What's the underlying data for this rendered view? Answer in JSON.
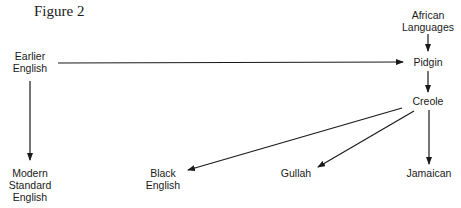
{
  "figure": {
    "title": "Figure  2"
  },
  "nodes": {
    "earlier_english": {
      "line1": "Earlier",
      "line2": "English"
    },
    "african_languages": {
      "line1": "African",
      "line2": "Languages"
    },
    "pidgin": {
      "label": "Pidgin"
    },
    "creole": {
      "label": "Creole"
    },
    "modern_standard_english": {
      "line1": "Modern",
      "line2": "Standard",
      "line3": "English"
    },
    "black_english": {
      "line1": "Black",
      "line2": "English"
    },
    "gullah": {
      "label": "Gullah"
    },
    "jamaican": {
      "label": "Jamaican"
    }
  },
  "edges": [
    {
      "from": "African Languages",
      "to": "Pidgin"
    },
    {
      "from": "Earlier English",
      "to": "Pidgin"
    },
    {
      "from": "Pidgin",
      "to": "Creole"
    },
    {
      "from": "Earlier English",
      "to": "Modern Standard English"
    },
    {
      "from": "Creole",
      "to": "Black English"
    },
    {
      "from": "Creole",
      "to": "Gullah"
    },
    {
      "from": "Creole",
      "to": "Jamaican"
    }
  ],
  "colors": {
    "ink": "#1a1a1a",
    "background": "#ffffff"
  }
}
